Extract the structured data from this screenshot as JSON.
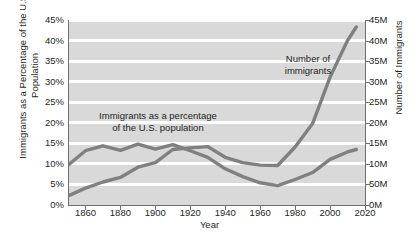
{
  "chart_data": {
    "type": "line",
    "title": "",
    "xlabel": "Year",
    "ylabel_left": "Immigrants as a Percentage of the U.S. Population",
    "ylabel_right": "Number of Immigrants",
    "xlim": [
      1850,
      2020
    ],
    "xticks": [
      1860,
      1880,
      1900,
      1920,
      1940,
      1960,
      1980,
      2000,
      2020
    ],
    "xtick_labels": [
      "1860",
      "1880",
      "1900",
      "1920",
      "1940",
      "1960",
      "1980",
      "2000",
      "2020"
    ],
    "ylim_left": [
      0,
      45
    ],
    "yticks_left": [
      0,
      5,
      10,
      15,
      20,
      25,
      30,
      35,
      40,
      45
    ],
    "ytick_labels_left": [
      "0%",
      "5%",
      "10%",
      "15%",
      "20%",
      "25%",
      "30%",
      "35%",
      "40%",
      "45%"
    ],
    "ylim_right": [
      0,
      45
    ],
    "yticks_right": [
      0,
      5,
      10,
      15,
      20,
      25,
      30,
      35,
      40,
      45
    ],
    "ytick_labels_right": [
      "0M",
      "50M",
      "10M",
      "15M",
      "20M",
      "25M",
      "30M",
      "35M",
      "40M",
      "45M"
    ],
    "grid": true,
    "grid_color": "#ffffff",
    "plot_background": "#d9d9d9",
    "line_color": "#808080",
    "legend_position": "in-plot annotations",
    "annotations": [
      {
        "name": "percentage-series-label",
        "text_lines": [
          "Immigrants as a percentage",
          "of the U.S. population"
        ],
        "x": 1882,
        "y": 19
      },
      {
        "name": "number-series-label",
        "text_lines": [
          "Number of",
          "immigrants"
        ],
        "x": 1967,
        "y": 34
      }
    ],
    "series": [
      {
        "name": "Immigrants as a percentage of the U.S. population",
        "axis": "left",
        "unit": "percent",
        "color": "#808080",
        "x": [
          1850,
          1860,
          1870,
          1880,
          1890,
          1900,
          1910,
          1920,
          1930,
          1940,
          1950,
          1960,
          1970,
          1980,
          1990,
          2000,
          2010,
          2015
        ],
        "values": [
          9.7,
          13.2,
          14.4,
          13.3,
          14.8,
          13.6,
          14.7,
          13.2,
          11.6,
          8.8,
          6.9,
          5.4,
          4.7,
          6.2,
          7.9,
          11.1,
          12.9,
          13.5
        ]
      },
      {
        "name": "Number of immigrants",
        "axis": "right",
        "unit": "millions",
        "color": "#808080",
        "x": [
          1850,
          1860,
          1870,
          1880,
          1890,
          1900,
          1910,
          1920,
          1930,
          1940,
          1950,
          1960,
          1970,
          1980,
          1990,
          2000,
          2010,
          2015
        ],
        "values": [
          2.2,
          4.1,
          5.6,
          6.7,
          9.2,
          10.3,
          13.5,
          13.9,
          14.2,
          11.6,
          10.3,
          9.7,
          9.6,
          14.1,
          19.8,
          31.1,
          40.0,
          43.3
        ]
      }
    ]
  }
}
